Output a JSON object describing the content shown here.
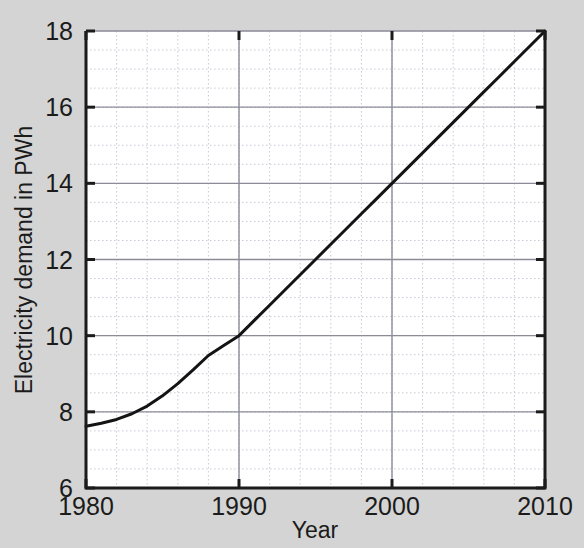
{
  "chart_data": {
    "type": "line",
    "title": "",
    "subtitle": "",
    "xlabel": "Year",
    "ylabel": "Electricity demand in PWh",
    "xlim": [
      1980,
      2010
    ],
    "ylim": [
      6,
      18
    ],
    "xticks": [
      1980,
      1990,
      2000,
      2010
    ],
    "xtick_labels": [
      "1980",
      "1990",
      "2000",
      "2010"
    ],
    "yticks": [
      6,
      8,
      10,
      12,
      14,
      16,
      18
    ],
    "ytick_labels": [
      "6",
      "8",
      "10",
      "12",
      "14",
      "16",
      "18"
    ],
    "x_minor_step": 2,
    "y_minor_step": 0.5,
    "grid": true,
    "major_grid_color": "#8c8c99",
    "minor_grid_color": "#c9c9d6",
    "legend": "none",
    "series": [
      {
        "name": "Electricity demand",
        "color": "#141414",
        "line_width": 3,
        "x": [
          1980,
          1981,
          1982,
          1983,
          1984,
          1985,
          1986,
          1987,
          1988,
          1989,
          1990,
          1991,
          1992,
          1993,
          1994,
          1995,
          1996,
          1997,
          1998,
          1999,
          2000,
          2001,
          2002,
          2003,
          2004,
          2005,
          2006,
          2007,
          2008,
          2009,
          2010
        ],
        "values": [
          7.62,
          7.7,
          7.8,
          7.95,
          8.15,
          8.42,
          8.74,
          9.1,
          9.48,
          9.74,
          10.0,
          10.4,
          10.8,
          11.2,
          11.6,
          12.0,
          12.4,
          12.8,
          13.2,
          13.6,
          14.0,
          14.4,
          14.8,
          15.2,
          15.6,
          16.0,
          16.4,
          16.8,
          17.2,
          17.6,
          18.0
        ]
      }
    ]
  },
  "axis_labels": {
    "x_title": "Year",
    "y_title": "Electricity demand in PWh"
  },
  "background_color": "#d4d4d4",
  "plot_background_color": "#ffffff"
}
